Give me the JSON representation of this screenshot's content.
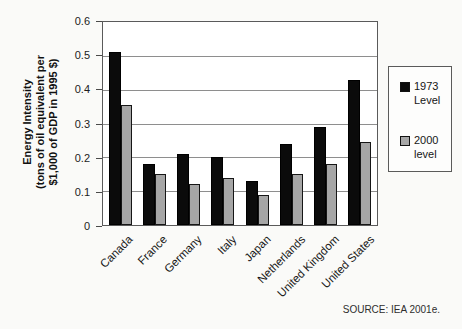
{
  "chart_data": {
    "type": "bar",
    "title": "",
    "categories": [
      "Canada",
      "France",
      "Germany",
      "Italy",
      "Japan",
      "Netherlands",
      "United Kingdom",
      "United States"
    ],
    "series": [
      {
        "name": "1973 Level",
        "color": "#0b0b0b",
        "values": [
          0.51,
          0.18,
          0.21,
          0.2,
          0.13,
          0.24,
          0.29,
          0.43
        ]
      },
      {
        "name": "2000 level",
        "color": "#a6a6a6",
        "values": [
          0.355,
          0.15,
          0.12,
          0.14,
          0.09,
          0.15,
          0.18,
          0.245
        ]
      }
    ],
    "ylabel_lines": [
      "Energy Intensity",
      "(tons of oil equivalent per",
      "$1,000 of GDP in 1995 $)"
    ],
    "xlabel": "",
    "ylim": [
      0,
      0.6
    ],
    "ytick_step": 0.1,
    "yticks": [
      "0.6",
      "0.5",
      "0.4",
      "0.3",
      "0.2",
      "0.1",
      "0"
    ],
    "grid": true,
    "legend_position": "right"
  },
  "legend": {
    "items": [
      {
        "label_line1": "1973",
        "label_line2": "Level",
        "color": "#0b0b0b"
      },
      {
        "label_line1": "2000",
        "label_line2": "level",
        "color": "#a6a6a6"
      }
    ]
  },
  "source_note": "SOURCE: IEA 2001e.",
  "colors": {
    "bar_1973": "#0b0b0b",
    "bar_2000": "#a6a6a6",
    "gridline": "#8e8e8e",
    "axis": "#5a5a5a",
    "plot_background": "#ffffff",
    "page_background": "#fafaf8"
  }
}
